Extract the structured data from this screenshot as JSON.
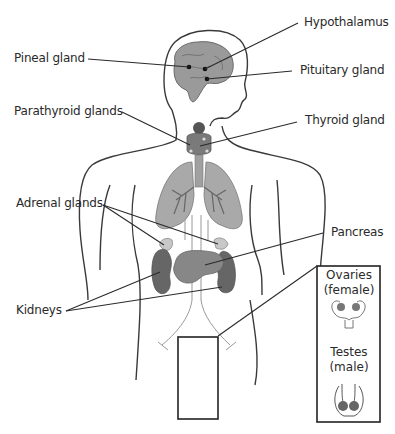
{
  "diagram": {
    "type": "endocrine system anatomy",
    "labels": {
      "hypothalamus": "Hypothalamus",
      "pineal": "Pineal gland",
      "pituitary": "Pituitary gland",
      "parathyroid": "Parathyroid glands",
      "thyroid": "Thyroid gland",
      "adrenal": "Adrenal glands",
      "pancreas": "Pancreas",
      "kidneys": "Kidneys"
    },
    "inset": {
      "ovaries_line1": "Ovaries",
      "ovaries_line2": "(female)",
      "testes_line1": "Testes",
      "testes_line2": "(male)"
    },
    "colors": {
      "organ_dark": "#6e6e6e",
      "organ_mid": "#8e8e8e",
      "organ_light": "#b8b8b8",
      "outline": "#333333"
    }
  }
}
